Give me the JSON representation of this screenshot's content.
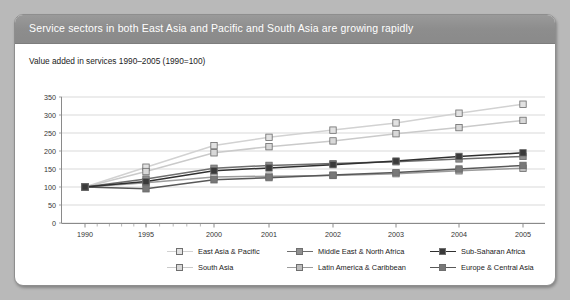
{
  "figure": {
    "title": "Service sectors in both East Asia and Pacific and South Asia are growing rapidly",
    "subtitle": "Value added in services 1990–2005 (1990=100)",
    "source": "Source: World Development Indicators database"
  },
  "chart_data": {
    "type": "line",
    "title": "Value added in services 1990–2005 (1990=100)",
    "xlabel": "",
    "ylabel": "",
    "categories": [
      "1990",
      "1995",
      "2000",
      "2001",
      "2002",
      "2003",
      "2004",
      "2005"
    ],
    "x_tick_labels": [
      "1990",
      "1995",
      "2000",
      "2001",
      "2002",
      "2003",
      "2004",
      "2005"
    ],
    "y_tick_labels": [
      "0",
      "50",
      "100",
      "150",
      "200",
      "250",
      "300",
      "350"
    ],
    "ylim": [
      0,
      350
    ],
    "y_tick_step": 50,
    "grid": "horizontal",
    "legend_position": "bottom",
    "series": [
      {
        "name": "East Asia & Pacific",
        "color": "#e2e2e2",
        "line_color": "#d2d2d2",
        "values": [
          100,
          155,
          215,
          238,
          258,
          278,
          305,
          330
        ]
      },
      {
        "name": "South Asia",
        "color": "#d8d8d8",
        "line_color": "#cacaca",
        "values": [
          100,
          143,
          195,
          212,
          228,
          248,
          265,
          285
        ]
      },
      {
        "name": "Middle East & North Africa",
        "color": "#8f8f8f",
        "line_color": "#6e6e6e",
        "values": [
          100,
          122,
          152,
          160,
          165,
          170,
          178,
          185
        ]
      },
      {
        "name": "Latin America & Caribbean",
        "color": "#bdbdbd",
        "line_color": "#9c9c9c",
        "values": [
          100,
          112,
          128,
          130,
          132,
          137,
          145,
          152
        ]
      },
      {
        "name": "Sub-Saharan Africa",
        "color": "#3a3a3a",
        "line_color": "#303030",
        "values": [
          100,
          115,
          145,
          153,
          162,
          172,
          185,
          195
        ]
      },
      {
        "name": "Europe & Central Asia",
        "color": "#787878",
        "line_color": "#585858",
        "values": [
          100,
          95,
          120,
          126,
          133,
          140,
          150,
          160
        ]
      }
    ],
    "legend_order": [
      "East Asia & Pacific",
      "Middle East & North Africa",
      "Sub-Saharan Africa",
      "South Asia",
      "Latin America & Caribbean",
      "Europe & Central Asia"
    ]
  }
}
